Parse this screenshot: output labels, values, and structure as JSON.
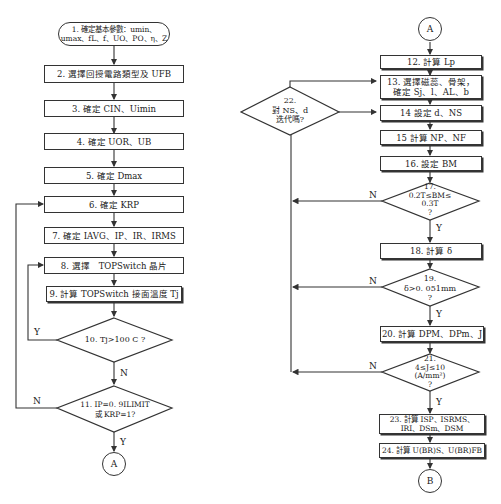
{
  "flowchart": {
    "left": {
      "start": "1. 確定基本參數：umin、umax、fL、f、UO、PO、η、Z",
      "steps": [
        "2. 選擇回授電路類型及 UFB",
        "3. 確定 CIN、Uimin",
        "4. 確定 UOR、UB",
        "5. 確定 Dmax",
        "6. 確定 KRP",
        "7. 確定 IAVG、IP、IR、IRMS",
        "8. 選擇　TOPSwitch 晶片",
        "9. 計算 TOPSwitch 接面溫度 Tj"
      ],
      "decisions": [
        {
          "text": "10. Tj>100 C ?",
          "yes": "Y",
          "no": "N"
        },
        {
          "text": "11. IP=0. 9ILIMIT 或 KRP=1?",
          "yes": "Y",
          "no": "N"
        }
      ],
      "connector_end": "A"
    },
    "right": {
      "connector_start": "A",
      "steps": [
        "12. 計算 Lp",
        "13. 選擇磁蕊、骨架，確定 Sj、l、AL、b",
        "14 設定 d、NS",
        "15 計算 NP、NF",
        "16. 設定 BM",
        "18. 計算 δ",
        "20. 計算 DPM、DPm、J",
        "23. 計算 ISP、ISRMS、IRI、DSm、DSM",
        "24. 計算 U(BR)S、U(BR)FB"
      ],
      "decisions": [
        {
          "text": "17. 0.2T≤BM≤0.3T ?",
          "yes": "Y",
          "no": "N"
        },
        {
          "text": "19. δ>0. 051mm ?",
          "yes": "Y",
          "no": "N"
        },
        {
          "text": "21. 4≤J≤10 (A/mm²) ?",
          "yes": "Y",
          "no": "N"
        },
        {
          "text": "22. 對 NS、d 迭代嗎?"
        }
      ],
      "connector_end": "B"
    }
  },
  "labels": {
    "start_l1": "1. 確定基本參數：umin、",
    "start_l2": "umax、fL、f、UO、PO、η、Z",
    "s2": "2. 選擇回授電路類型及 UFB",
    "s3": "3. 確定 CIN、Uimin",
    "s4": "4. 確定 UOR、UB",
    "s5": "5. 確定 Dmax",
    "s6": "6. 確定 KRP",
    "s7": "7. 確定 IAVG、IP、IR、IRMS",
    "s8": "8. 選擇　TOPSwitch 晶片",
    "s9": "9. 計算 TOPSwitch 接面溫度 Tj",
    "d10": "10. Tj>100 C ?",
    "d11_l1": "11. IP=0. 9ILIMIT",
    "d11_l2": "或 KRP=1?",
    "cA": "A",
    "cA2": "A",
    "cB": "B",
    "s12": "12. 計算 Lp",
    "s13_l1": "13. 選擇磁蕊、骨架，",
    "s13_l2": "確定 Sj、l、AL、b",
    "s14": "14 設定 d、NS",
    "s15": "15 計算 NP、NF",
    "s16": "16. 設定 BM",
    "d17_l1": "17.",
    "d17_l2": "0.2T≤BM≤",
    "d17_l3": "0.3T",
    "d17_l4": "?",
    "s18": "18. 計算 δ",
    "d19_l1": "19.",
    "d19_l2": "δ>0. 051mm",
    "d19_l3": "?",
    "s20": "20. 計算 DPM、DPm、J",
    "d21_l1": "21.",
    "d21_l2": "4≤J≤10",
    "d21_l3": "(A/mm²)",
    "d21_l4": "?",
    "d22_l1": "22.",
    "d22_l2": "對 NS、d",
    "d22_l3": "迭代嗎?",
    "s23_l1": "23. 計算 ISP、ISRMS、",
    "s23_l2": "IRI、DSm、DSM",
    "s24": "24. 計算 U(BR)S、U(BR)FB",
    "Y": "Y",
    "N": "N"
  }
}
